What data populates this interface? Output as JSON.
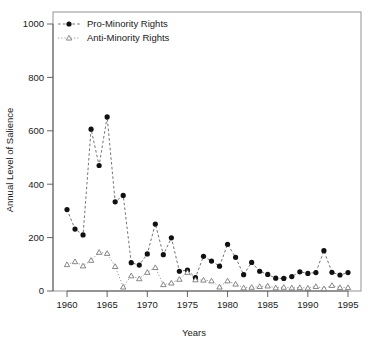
{
  "chart_data": {
    "type": "line",
    "title": "",
    "xlabel": "Years",
    "ylabel": "Annual Level of Salience",
    "xlim": [
      1958.5,
      1996.5
    ],
    "ylim": [
      0,
      1000
    ],
    "grid": false,
    "legend_position": "top-left",
    "xticks": [
      1960,
      1965,
      1970,
      1975,
      1980,
      1985,
      1990,
      1995
    ],
    "xtick_labels": [
      "1960",
      "1965",
      "1970",
      "1975",
      "1980",
      "1985",
      "1990",
      "1995"
    ],
    "yticks": [
      0,
      200,
      400,
      600,
      800,
      1000
    ],
    "ytick_labels": [
      "0",
      "200",
      "400",
      "600",
      "800",
      "1000"
    ],
    "x": [
      1960,
      1961,
      1962,
      1963,
      1964,
      1965,
      1966,
      1967,
      1968,
      1969,
      1970,
      1971,
      1972,
      1973,
      1974,
      1975,
      1976,
      1977,
      1978,
      1979,
      1980,
      1981,
      1982,
      1983,
      1984,
      1985,
      1986,
      1987,
      1988,
      1989,
      1990,
      1991,
      1992,
      1993,
      1994,
      1995
    ],
    "series": [
      {
        "name": "Pro-Minority Rights",
        "marker": "filled-circle",
        "line_style": "dashed",
        "color": "#111111",
        "values": [
          305,
          232,
          210,
          606,
          470,
          652,
          334,
          358,
          106,
          97,
          139,
          251,
          136,
          199,
          74,
          78,
          50,
          130,
          112,
          93,
          175,
          126,
          61,
          107,
          74,
          62,
          48,
          47,
          54,
          72,
          66,
          69,
          151,
          70,
          60,
          69
        ]
      },
      {
        "name": "Anti-Minority Rights",
        "marker": "open-triangle",
        "line_style": "dotted",
        "color": "#6b6b6b",
        "values": [
          99,
          110,
          94,
          115,
          145,
          141,
          92,
          15,
          57,
          46,
          70,
          88,
          24,
          30,
          44,
          70,
          42,
          41,
          38,
          15,
          38,
          26,
          12,
          14,
          17,
          19,
          12,
          14,
          12,
          13,
          11,
          17,
          9,
          21,
          13,
          13
        ]
      }
    ]
  },
  "legend": {
    "entries": [
      {
        "label": "Pro-Minority Rights",
        "marker": "filled-circle"
      },
      {
        "label": "Anti-Minority Rights",
        "marker": "open-triangle"
      }
    ]
  },
  "axes": {
    "x_title": "Years",
    "y_title": "Annual Level of Salience"
  }
}
